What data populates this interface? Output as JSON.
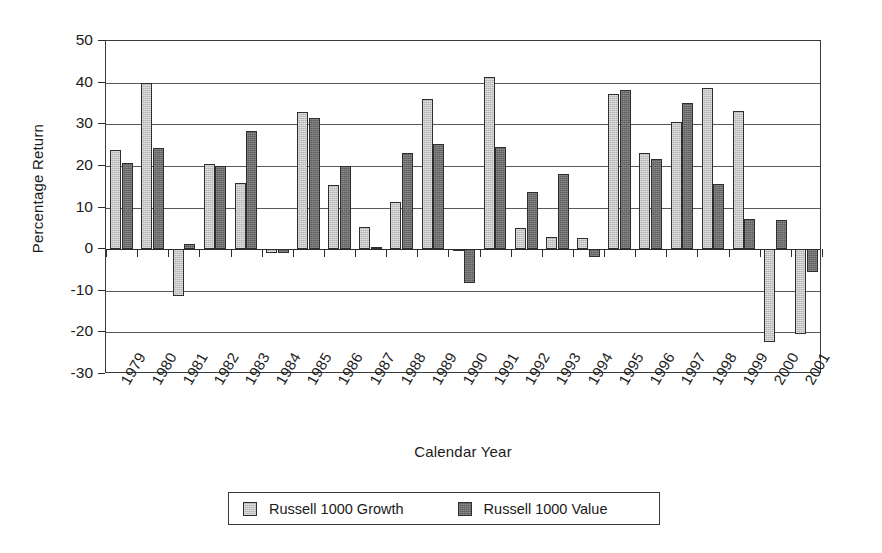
{
  "chart_data": {
    "type": "bar",
    "title": "",
    "xlabel": "Calendar Year",
    "ylabel": "Percentage Return",
    "ylim": [
      -30,
      50
    ],
    "yticks": [
      50,
      40,
      30,
      20,
      10,
      0,
      -10,
      -20,
      -30
    ],
    "ytick_labels": [
      "50",
      "40",
      "30",
      "20",
      "10",
      "0",
      "-10",
      "-20",
      "-30"
    ],
    "grid": true,
    "legend_position": "bottom",
    "categories": [
      "1979",
      "1980",
      "1981",
      "1982",
      "1983",
      "1984",
      "1985",
      "1986",
      "1987",
      "1988",
      "1989",
      "1990",
      "1991",
      "1992",
      "1993",
      "1994",
      "1995",
      "1996",
      "1997",
      "1998",
      "1999",
      "2000",
      "2001"
    ],
    "series": [
      {
        "name": "Russell 1000 Growth",
        "color": "#b3b3b3",
        "values": [
          23.9,
          39.9,
          -11.3,
          20.5,
          15.9,
          -1.0,
          32.9,
          15.4,
          5.3,
          11.3,
          36.0,
          -0.3,
          41.3,
          5.0,
          2.9,
          2.6,
          37.2,
          23.1,
          30.5,
          38.7,
          33.2,
          -22.4,
          -20.4
        ]
      },
      {
        "name": "Russell 1000 Value",
        "color": "#5e5e5e",
        "values": [
          20.6,
          24.4,
          1.3,
          20.0,
          28.3,
          -1.0,
          31.5,
          19.9,
          0.5,
          23.2,
          25.2,
          -8.1,
          24.6,
          13.8,
          18.1,
          -2.0,
          38.3,
          21.6,
          35.2,
          15.6,
          7.3,
          7.0,
          -5.6
        ]
      }
    ]
  },
  "axes": {
    "ylabel": "Percentage Return",
    "xlabel": "Calendar Year"
  },
  "legend": {
    "items": [
      {
        "label": "Russell 1000 Growth",
        "swatch": "growth-swatch"
      },
      {
        "label": "Russell 1000 Value",
        "swatch": "value-swatch"
      }
    ]
  }
}
